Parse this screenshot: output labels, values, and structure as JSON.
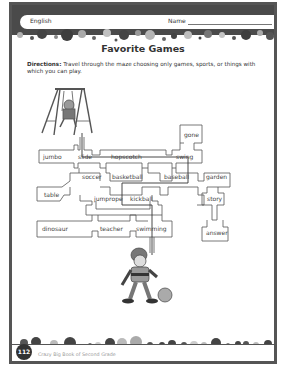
{
  "header": {
    "subject": "English",
    "name_label": "Name"
  },
  "worksheet": {
    "title": "Favorite Games",
    "directions_label": "Directions:",
    "directions_text": " Travel through the maze choosing only games, sports, or things with which you can play."
  },
  "maze": {
    "words": {
      "jumbo": "jumbo",
      "slide": "slide",
      "hopscotch": "hopscotch",
      "gone": "gone",
      "swing": "swing",
      "table": "table",
      "soccer": "soccer",
      "basketball": "basketball",
      "baseball": "baseball",
      "garden": "garden",
      "jumprope": "jumprope",
      "kickball": "kickball",
      "story": "story",
      "dinosaur": "dinosaur",
      "teacher": "teacher",
      "swimming": "swimming",
      "answer": "answer"
    },
    "start_picture": "swing-set-child",
    "end_picture": "boy-kicking-ball"
  },
  "footer": {
    "page_number": "112",
    "book_title": "Crazy Big Book of Second Grade"
  },
  "colors": {
    "frame": "#555555",
    "dot_dark": "#4a4a4a",
    "dot_light": "#b8b8b8",
    "text": "#333333"
  }
}
